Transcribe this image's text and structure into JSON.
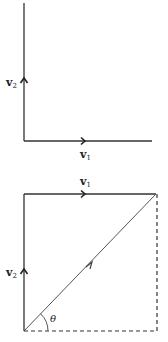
{
  "figure_top": {
    "v2_label": "v",
    "v2_sub": "2",
    "v1_label": "v",
    "v1_sub": "1"
  },
  "figure_bottom": {
    "v1_label": "v",
    "v1_sub": "1",
    "v2_label": "v",
    "v2_sub": "2",
    "angle_label": "θ"
  },
  "colors": {
    "line": "#333333",
    "diagonal": "#555555"
  }
}
